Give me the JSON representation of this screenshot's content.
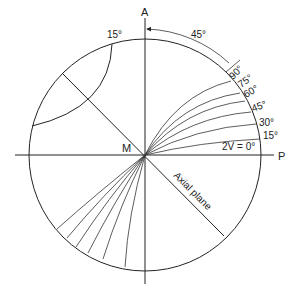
{
  "diagram": {
    "labels": {
      "top_axis": "A",
      "right_axis": "P",
      "center": "M",
      "angle_arc": "45°",
      "upper_left_angle": "15°",
      "axial_plane": "Axial plane",
      "twoV_zero": "2V = 0°"
    },
    "twoV_curves": [
      {
        "label": "15°"
      },
      {
        "label": "30°"
      },
      {
        "label": "45°"
      },
      {
        "label": "60°"
      },
      {
        "label": "75°"
      },
      {
        "label": "90°"
      }
    ],
    "colors": {
      "stroke": "#222222",
      "background": "#ffffff"
    }
  }
}
